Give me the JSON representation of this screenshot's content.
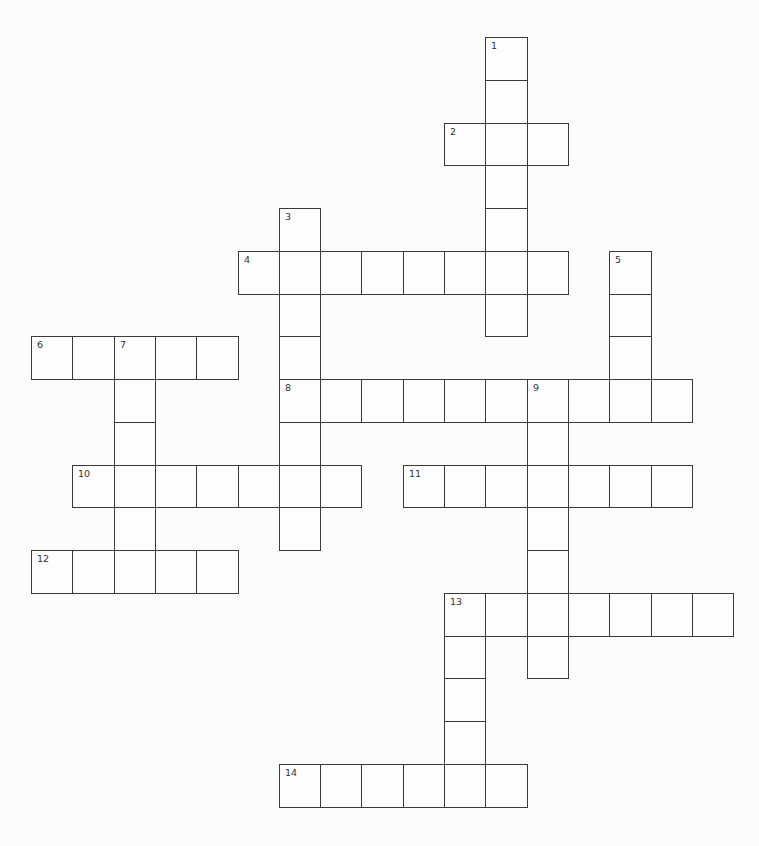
{
  "puzzle": {
    "layout": {
      "origin_x": 31,
      "origin_y": 37,
      "cell_width": 41.3,
      "cell_height": 42.75
    },
    "colors": {
      "background": "#fcfcfc",
      "cell_fill": "#fdfdfd",
      "cell_border": "#3a3a3a",
      "number_text": "#333333"
    },
    "words": [
      {
        "number": "1",
        "direction": "down",
        "row": 0,
        "col": 11,
        "length": 7,
        "value": ""
      },
      {
        "number": "2",
        "direction": "across",
        "row": 2,
        "col": 10,
        "length": 3,
        "value": ""
      },
      {
        "number": "3",
        "direction": "down",
        "row": 4,
        "col": 6,
        "length": 8,
        "value": ""
      },
      {
        "number": "4",
        "direction": "across",
        "row": 5,
        "col": 5,
        "length": 8,
        "value": ""
      },
      {
        "number": "5",
        "direction": "down",
        "row": 5,
        "col": 14,
        "length": 4,
        "value": ""
      },
      {
        "number": "6",
        "direction": "across",
        "row": 7,
        "col": 0,
        "length": 5,
        "value": ""
      },
      {
        "number": "7",
        "direction": "down",
        "row": 7,
        "col": 2,
        "length": 6,
        "value": ""
      },
      {
        "number": "8",
        "direction": "across",
        "row": 8,
        "col": 6,
        "length": 10,
        "value": ""
      },
      {
        "number": "9",
        "direction": "down",
        "row": 8,
        "col": 12,
        "length": 7,
        "value": ""
      },
      {
        "number": "10",
        "direction": "across",
        "row": 10,
        "col": 1,
        "length": 7,
        "value": ""
      },
      {
        "number": "11",
        "direction": "across",
        "row": 10,
        "col": 9,
        "length": 7,
        "value": ""
      },
      {
        "number": "12",
        "direction": "across",
        "row": 12,
        "col": 0,
        "length": 5,
        "value": ""
      },
      {
        "number": "13",
        "direction": "across",
        "row": 13,
        "col": 10,
        "length": 7,
        "value": ""
      },
      {
        "number": "13",
        "direction": "down",
        "row": 13,
        "col": 10,
        "length": 5,
        "value": ""
      },
      {
        "number": "14",
        "direction": "across",
        "row": 17,
        "col": 6,
        "length": 6,
        "value": ""
      }
    ]
  }
}
